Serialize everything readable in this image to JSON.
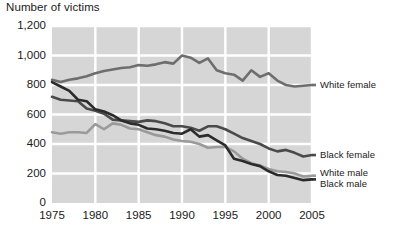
{
  "chart_data": {
    "type": "line",
    "title": "Number of victims",
    "xlabel": "",
    "ylabel": "",
    "xlim": [
      1975,
      2005
    ],
    "ylim": [
      0,
      1200
    ],
    "grid": true,
    "legend_position": "right",
    "x_ticks": [
      "1975",
      "1980",
      "1985",
      "1990",
      "1995",
      "2000",
      "2005"
    ],
    "x_tick_values": [
      1975,
      1980,
      1985,
      1990,
      1995,
      2000,
      2005
    ],
    "y_ticks": [
      "0",
      "200",
      "400",
      "600",
      "800",
      "1,000",
      "1,200"
    ],
    "y_tick_values": [
      0,
      200,
      400,
      600,
      800,
      1000,
      1200
    ],
    "x": [
      1975,
      1976,
      1977,
      1978,
      1979,
      1980,
      1981,
      1982,
      1983,
      1984,
      1985,
      1986,
      1987,
      1988,
      1989,
      1990,
      1991,
      1992,
      1993,
      1994,
      1995,
      1996,
      1997,
      1998,
      1999,
      2000,
      2001,
      2002,
      2003,
      2004,
      2005
    ],
    "series": [
      {
        "name": "White female",
        "color": "#6e6e6e",
        "values": [
          835,
          820,
          835,
          845,
          860,
          880,
          895,
          905,
          915,
          920,
          935,
          930,
          940,
          955,
          945,
          1000,
          985,
          950,
          980,
          900,
          880,
          870,
          830,
          900,
          855,
          880,
          830,
          800,
          790,
          795,
          800
        ]
      },
      {
        "name": "Black female",
        "color": "#4a4a4a",
        "values": [
          720,
          700,
          695,
          690,
          640,
          625,
          605,
          565,
          560,
          555,
          550,
          560,
          555,
          540,
          520,
          520,
          510,
          490,
          520,
          520,
          500,
          470,
          440,
          420,
          400,
          370,
          350,
          360,
          340,
          315,
          325
        ]
      },
      {
        "name": "White male",
        "color": "#9a9a9a",
        "values": [
          480,
          470,
          480,
          480,
          475,
          535,
          500,
          540,
          530,
          505,
          500,
          480,
          460,
          450,
          430,
          420,
          415,
          400,
          375,
          380,
          380,
          350,
          300,
          270,
          255,
          230,
          215,
          210,
          200,
          180,
          185
        ]
      },
      {
        "name": "Black male",
        "color": "#2b2b2b",
        "values": [
          820,
          790,
          760,
          700,
          690,
          635,
          620,
          595,
          560,
          540,
          530,
          505,
          500,
          490,
          475,
          470,
          500,
          450,
          460,
          425,
          390,
          300,
          285,
          265,
          250,
          215,
          190,
          185,
          170,
          155,
          160
        ]
      }
    ]
  },
  "legend": {
    "items": [
      {
        "label": "White female"
      },
      {
        "label": "Black female"
      },
      {
        "label": "White male"
      },
      {
        "label": "Black male"
      }
    ]
  }
}
